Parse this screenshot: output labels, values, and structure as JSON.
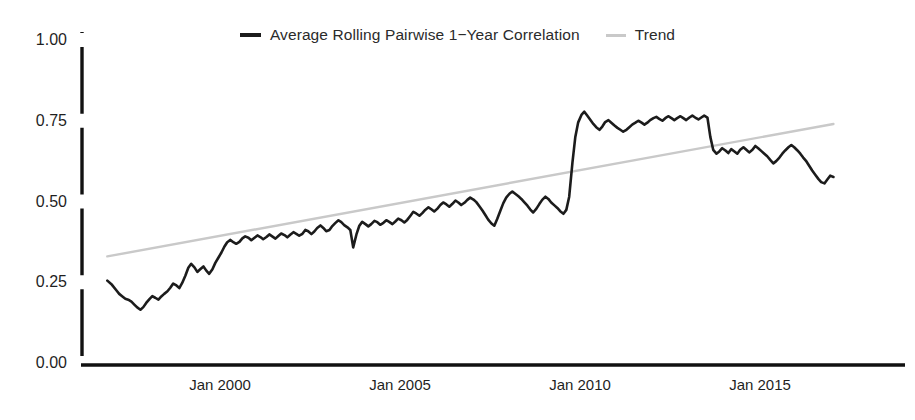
{
  "legend": {
    "position": "top-center",
    "items": [
      {
        "label": "Average Rolling Pairwise 1−Year Correlation",
        "color": "#1c1c1c",
        "icon": "line-swatch-dark"
      },
      {
        "label": "Trend",
        "color": "#c9c9c9",
        "icon": "line-swatch-light"
      }
    ]
  },
  "axes": {
    "y_ticks": [
      "0.00",
      "0.25",
      "0.50",
      "0.75",
      "1.00"
    ],
    "x_ticks": [
      "Jan 2000",
      "Jan 2005",
      "Jan 2010",
      "Jan 2015"
    ]
  },
  "chart_data": {
    "type": "line",
    "title": "",
    "xlabel": "",
    "ylabel": "",
    "grid": false,
    "legend_position": "top-center",
    "ylim": [
      0.0,
      1.0
    ],
    "yticks": [
      0.0,
      0.25,
      0.5,
      0.75,
      1.0
    ],
    "ytick_labels": [
      "0.00",
      "0.25",
      "0.50",
      "0.75",
      "1.00"
    ],
    "xlim": [
      "1996-11",
      "2017-02"
    ],
    "xticks": [
      "Jan 2000",
      "Jan 2005",
      "Jan 2010",
      "Jan 2015"
    ],
    "xtick_values": [
      2000.0,
      2005.0,
      2010.0,
      2015.0
    ],
    "series": [
      {
        "name": "Average Rolling Pairwise 1−Year Correlation",
        "color": "#1c1c1c",
        "width": 2.6,
        "x": [
          1996.87,
          1997.0,
          1997.12,
          1997.2,
          1997.29,
          1997.37,
          1997.45,
          1997.54,
          1997.62,
          1997.7,
          1997.79,
          1997.87,
          1997.95,
          1998.04,
          1998.12,
          1998.2,
          1998.29,
          1998.37,
          1998.45,
          1998.54,
          1998.62,
          1998.7,
          1998.79,
          1998.87,
          1998.95,
          1999.04,
          1999.12,
          1999.2,
          1999.29,
          1999.37,
          1999.45,
          1999.54,
          1999.62,
          1999.7,
          1999.79,
          1999.87,
          1999.95,
          2000.04,
          2000.12,
          2000.2,
          2000.29,
          2000.37,
          2000.45,
          2000.54,
          2000.62,
          2000.7,
          2000.79,
          2000.87,
          2000.95,
          2001.04,
          2001.12,
          2001.2,
          2001.29,
          2001.37,
          2001.45,
          2001.54,
          2001.62,
          2001.7,
          2001.79,
          2001.87,
          2001.95,
          2002.04,
          2002.12,
          2002.2,
          2002.29,
          2002.37,
          2002.45,
          2002.54,
          2002.62,
          2002.7,
          2002.79,
          2002.87,
          2002.95,
          2003.04,
          2003.12,
          2003.2,
          2003.29,
          2003.37,
          2003.45,
          2003.54,
          2003.62,
          2003.7,
          2003.79,
          2003.87,
          2003.95,
          2004.04,
          2004.12,
          2004.2,
          2004.29,
          2004.37,
          2004.45,
          2004.54,
          2004.62,
          2004.7,
          2004.79,
          2004.87,
          2004.95,
          2005.04,
          2005.12,
          2005.2,
          2005.29,
          2005.37,
          2005.45,
          2005.54,
          2005.62,
          2005.7,
          2005.79,
          2005.87,
          2005.95,
          2006.04,
          2006.12,
          2006.2,
          2006.29,
          2006.37,
          2006.45,
          2006.54,
          2006.62,
          2006.7,
          2006.79,
          2006.87,
          2006.95,
          2007.04,
          2007.12,
          2007.2,
          2007.29,
          2007.37,
          2007.45,
          2007.54,
          2007.62,
          2007.7,
          2007.79,
          2007.87,
          2007.95,
          2008.04,
          2008.12,
          2008.2,
          2008.29,
          2008.37,
          2008.45,
          2008.54,
          2008.62,
          2008.7,
          2008.79,
          2008.87,
          2008.95,
          2009.04,
          2009.12,
          2009.2,
          2009.29,
          2009.37,
          2009.45,
          2009.54,
          2009.62,
          2009.7,
          2009.79,
          2009.87,
          2009.95,
          2010.04,
          2010.12,
          2010.2,
          2010.29,
          2010.37,
          2010.45,
          2010.54,
          2010.62,
          2010.7,
          2010.79,
          2010.87,
          2010.95,
          2011.04,
          2011.12,
          2011.2,
          2011.29,
          2011.37,
          2011.45,
          2011.54,
          2011.62,
          2011.7,
          2011.79,
          2011.87,
          2011.95,
          2012.04,
          2012.12,
          2012.2,
          2012.29,
          2012.37,
          2012.45,
          2012.54,
          2012.62,
          2012.7,
          2012.79,
          2012.87,
          2012.95,
          2013.04,
          2013.12,
          2013.2,
          2013.29,
          2013.37,
          2013.45,
          2013.54,
          2013.62,
          2013.7,
          2013.79,
          2013.87,
          2013.95,
          2014.04,
          2014.12,
          2014.2,
          2014.29,
          2014.37,
          2014.45,
          2014.54,
          2014.62,
          2014.7,
          2014.79,
          2014.87,
          2014.95,
          2015.04,
          2015.12,
          2015.2,
          2015.29,
          2015.37,
          2015.45,
          2015.54,
          2015.62,
          2015.7,
          2015.79,
          2015.87,
          2015.95,
          2016.04,
          2016.12,
          2016.2,
          2016.29,
          2016.37,
          2016.45,
          2016.54,
          2016.62,
          2016.7,
          2016.79,
          2016.87,
          2016.95,
          2017.04
        ],
        "y": [
          0.255,
          0.242,
          0.225,
          0.214,
          0.206,
          0.199,
          0.196,
          0.19,
          0.181,
          0.172,
          0.165,
          0.173,
          0.186,
          0.198,
          0.207,
          0.202,
          0.196,
          0.206,
          0.214,
          0.222,
          0.233,
          0.246,
          0.24,
          0.232,
          0.248,
          0.271,
          0.295,
          0.307,
          0.296,
          0.282,
          0.29,
          0.299,
          0.286,
          0.276,
          0.29,
          0.31,
          0.325,
          0.342,
          0.36,
          0.374,
          0.381,
          0.374,
          0.369,
          0.375,
          0.386,
          0.392,
          0.388,
          0.38,
          0.387,
          0.395,
          0.39,
          0.383,
          0.39,
          0.398,
          0.392,
          0.385,
          0.393,
          0.401,
          0.396,
          0.389,
          0.397,
          0.405,
          0.4,
          0.394,
          0.4,
          0.412,
          0.408,
          0.399,
          0.407,
          0.418,
          0.426,
          0.418,
          0.408,
          0.412,
          0.424,
          0.433,
          0.442,
          0.436,
          0.427,
          0.42,
          0.412,
          0.358,
          0.398,
          0.425,
          0.437,
          0.43,
          0.423,
          0.43,
          0.44,
          0.436,
          0.428,
          0.434,
          0.442,
          0.437,
          0.43,
          0.438,
          0.447,
          0.442,
          0.435,
          0.443,
          0.456,
          0.468,
          0.463,
          0.456,
          0.464,
          0.474,
          0.482,
          0.476,
          0.469,
          0.478,
          0.489,
          0.497,
          0.491,
          0.484,
          0.492,
          0.503,
          0.497,
          0.489,
          0.496,
          0.505,
          0.512,
          0.506,
          0.498,
          0.486,
          0.472,
          0.458,
          0.444,
          0.432,
          0.425,
          0.446,
          0.472,
          0.495,
          0.512,
          0.524,
          0.531,
          0.524,
          0.516,
          0.508,
          0.498,
          0.487,
          0.475,
          0.466,
          0.478,
          0.492,
          0.505,
          0.515,
          0.508,
          0.497,
          0.488,
          0.48,
          0.47,
          0.462,
          0.474,
          0.515,
          0.62,
          0.7,
          0.745,
          0.768,
          0.778,
          0.766,
          0.752,
          0.74,
          0.73,
          0.722,
          0.732,
          0.746,
          0.752,
          0.744,
          0.736,
          0.728,
          0.722,
          0.716,
          0.722,
          0.73,
          0.738,
          0.744,
          0.75,
          0.745,
          0.738,
          0.744,
          0.752,
          0.758,
          0.762,
          0.756,
          0.75,
          0.758,
          0.764,
          0.758,
          0.752,
          0.758,
          0.764,
          0.758,
          0.752,
          0.76,
          0.766,
          0.76,
          0.754,
          0.76,
          0.766,
          0.76,
          0.7,
          0.66,
          0.648,
          0.655,
          0.665,
          0.658,
          0.65,
          0.662,
          0.655,
          0.648,
          0.66,
          0.668,
          0.66,
          0.652,
          0.66,
          0.672,
          0.665,
          0.656,
          0.648,
          0.64,
          0.628,
          0.618,
          0.625,
          0.636,
          0.648,
          0.658,
          0.668,
          0.675,
          0.668,
          0.658,
          0.648,
          0.636,
          0.624,
          0.61,
          0.596,
          0.582,
          0.57,
          0.56,
          0.556,
          0.568,
          0.58,
          0.576
        ]
      },
      {
        "name": "Trend",
        "color": "#c9c9c9",
        "width": 2.4,
        "x": [
          1996.87,
          2017.04
        ],
        "y": [
          0.33,
          0.74
        ]
      }
    ]
  }
}
